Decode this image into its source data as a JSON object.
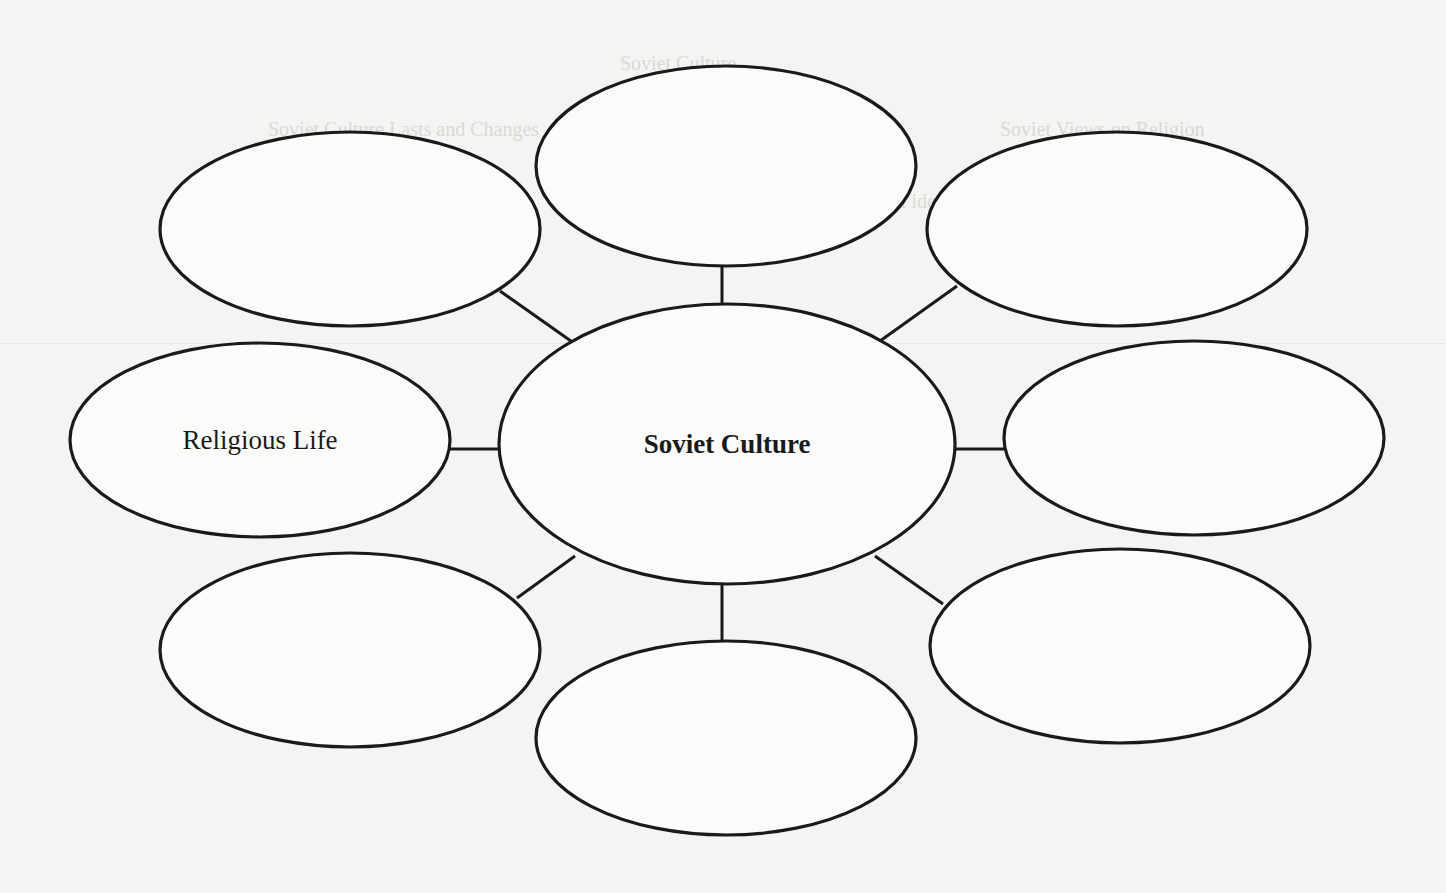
{
  "diagram": {
    "type": "bubble-map",
    "center": {
      "label": "Soviet Culture",
      "cx": 727,
      "cy": 444,
      "rx": 228,
      "ry": 140
    },
    "nodes": [
      {
        "id": "top",
        "label": "",
        "cx": 726,
        "cy": 166,
        "rx": 190,
        "ry": 100
      },
      {
        "id": "top-right",
        "label": "",
        "cx": 1117,
        "cy": 229,
        "rx": 190,
        "ry": 97
      },
      {
        "id": "right",
        "label": "",
        "cx": 1194,
        "cy": 438,
        "rx": 190,
        "ry": 97
      },
      {
        "id": "bottom-right",
        "label": "",
        "cx": 1120,
        "cy": 646,
        "rx": 190,
        "ry": 97
      },
      {
        "id": "bottom",
        "label": "",
        "cx": 726,
        "cy": 738,
        "rx": 190,
        "ry": 97
      },
      {
        "id": "bottom-left",
        "label": "",
        "cx": 350,
        "cy": 650,
        "rx": 190,
        "ry": 97
      },
      {
        "id": "left",
        "label": "Religious Life",
        "cx": 260,
        "cy": 440,
        "rx": 190,
        "ry": 97
      },
      {
        "id": "top-left",
        "label": "",
        "cx": 350,
        "cy": 229,
        "rx": 190,
        "ry": 97
      }
    ],
    "connectors": [
      {
        "to": "top",
        "x1": 722,
        "y1": 266,
        "x2": 722,
        "y2": 313
      },
      {
        "to": "top-right",
        "x1": 957,
        "y1": 286,
        "x2": 873,
        "y2": 346
      },
      {
        "to": "right",
        "x1": 955,
        "y1": 449,
        "x2": 1004,
        "y2": 449
      },
      {
        "to": "bottom-right",
        "x1": 875,
        "y1": 556,
        "x2": 943,
        "y2": 604
      },
      {
        "to": "bottom",
        "x1": 722,
        "y1": 585,
        "x2": 722,
        "y2": 640
      },
      {
        "to": "bottom-left",
        "x1": 575,
        "y1": 556,
        "x2": 517,
        "y2": 598
      },
      {
        "to": "left",
        "x1": 450,
        "y1": 449,
        "x2": 499,
        "y2": 449
      },
      {
        "to": "top-left",
        "x1": 500,
        "y1": 291,
        "x2": 578,
        "y2": 346
      }
    ],
    "stroke_color": "#1a1a1a",
    "fill_color": "#fbfbfa"
  },
  "background": {
    "bleed_through_text": [
      {
        "text": "Soviet Culture",
        "x": 620,
        "y": 52
      },
      {
        "text": "Soviet Culture Lasts and Changes",
        "x": 268,
        "y": 118
      },
      {
        "text": "Soviet Views on Religion",
        "x": 1000,
        "y": 118
      },
      {
        "text": "After World War II, the Soviets' official ideology",
        "x": 590,
        "y": 190
      },
      {
        "text": "The Soviet ideology and culture",
        "x": 276,
        "y": 222
      }
    ]
  }
}
